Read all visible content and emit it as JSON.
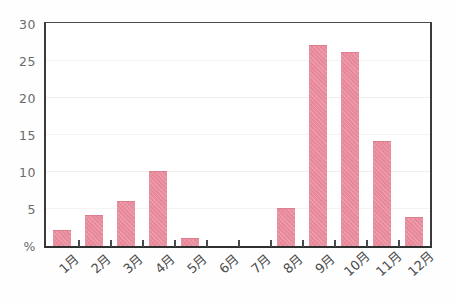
{
  "chart_data": {
    "type": "bar",
    "title": "",
    "subtitle": "",
    "xlabel": "",
    "ylabel": "%",
    "ylim": [
      0,
      30
    ],
    "yticks": [
      0,
      5,
      10,
      15,
      20,
      25,
      30
    ],
    "ytick_labels": [
      "%",
      "5",
      "10",
      "15",
      "20",
      "25",
      "30"
    ],
    "grid": true,
    "grid_axis": "y",
    "legend": false,
    "legend_position": "none",
    "bar_color": "#e98b9c",
    "axis_color": "#3a3a3a",
    "grid_color": "#f2eeee",
    "categories": [
      "1月",
      "2月",
      "3月",
      "4月",
      "5月",
      "6月",
      "7月",
      "8月",
      "9月",
      "10月",
      "11月",
      "12月"
    ],
    "values": [
      2.0,
      4.0,
      6.0,
      10.0,
      1.0,
      0,
      0,
      5.0,
      27.0,
      26.0,
      14.0,
      3.8
    ]
  }
}
